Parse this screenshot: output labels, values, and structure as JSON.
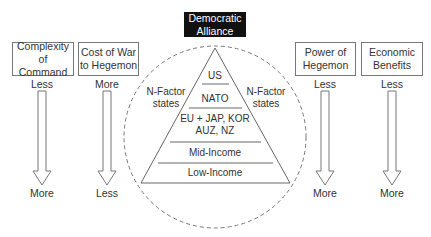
{
  "header": {
    "title_line1": "Democratic",
    "title_line2": "Alliance"
  },
  "columns": [
    {
      "title_line1": "Complexity",
      "title_line2": "of Command",
      "top": "Less",
      "bottom": "More"
    },
    {
      "title_line1": "Cost of War",
      "title_line2": "to Hegemon",
      "top": "More",
      "bottom": "Less"
    },
    {
      "title_line1": "Power of",
      "title_line2": "Hegemon",
      "top": "Less",
      "bottom": "More"
    },
    {
      "title_line1": "Economic",
      "title_line2": "Benefits",
      "top": "Less",
      "bottom": "More"
    }
  ],
  "side_labels": {
    "left_line1": "N-Factor",
    "left_line2": "states",
    "right_line1": "N-Factor",
    "right_line2": "states"
  },
  "pyramid": {
    "tiers": [
      {
        "line1": "US"
      },
      {
        "line1": "NATO"
      },
      {
        "line1": "EU + JAP, KOR",
        "line2": "AUZ, NZ"
      },
      {
        "line1": "Mid-Income"
      },
      {
        "line1": "Low-Income"
      }
    ]
  },
  "colors": {
    "header_bg": "#111111",
    "line": "#777777",
    "text": "#333333"
  }
}
